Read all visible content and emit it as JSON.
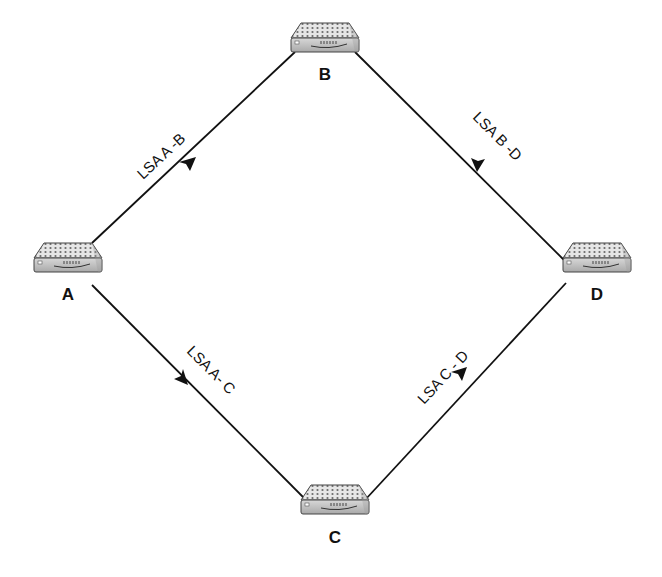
{
  "diagram": {
    "type": "network-topology",
    "colors": {
      "line": "#111111",
      "router_body": "#cfcfcf",
      "router_top": "#e4e4e4",
      "background": "#ffffff"
    },
    "nodes": [
      {
        "id": "A",
        "label": "A",
        "icon": "router-icon",
        "x": 68,
        "y": 265
      },
      {
        "id": "B",
        "label": "B",
        "icon": "router-icon",
        "x": 325,
        "y": 45
      },
      {
        "id": "C",
        "label": "C",
        "icon": "router-icon",
        "x": 335,
        "y": 505
      },
      {
        "id": "D",
        "label": "D",
        "icon": "router-icon",
        "x": 597,
        "y": 265
      }
    ],
    "links": [
      {
        "from": "A",
        "to": "B",
        "label": "LSA A -B",
        "arrow": "toward B"
      },
      {
        "from": "B",
        "to": "D",
        "label": "LSA B -D",
        "arrow": "toward D"
      },
      {
        "from": "A",
        "to": "C",
        "label": "LSA A- C",
        "arrow": "toward C"
      },
      {
        "from": "C",
        "to": "D",
        "label": "LSA C - D",
        "arrow": "toward D"
      }
    ]
  }
}
